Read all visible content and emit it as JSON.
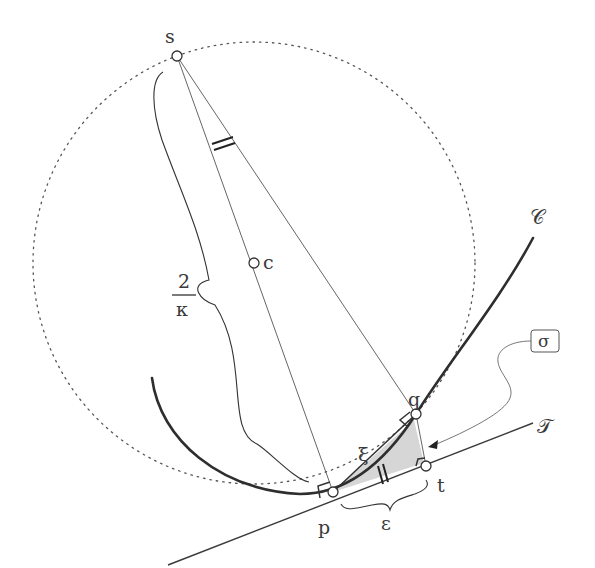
{
  "diagram": {
    "points": {
      "s": {
        "label": "s",
        "x": 177,
        "y": 56
      },
      "c": {
        "label": "c",
        "x": 254,
        "y": 263
      },
      "p": {
        "label": "p",
        "x": 333,
        "y": 492
      },
      "q": {
        "label": "q",
        "x": 416,
        "y": 414
      },
      "t": {
        "label": "t",
        "x": 426,
        "y": 466
      }
    },
    "labels": {
      "curve": "𝒞",
      "tangent": "𝒯",
      "sigma": "σ",
      "xi": "ξ",
      "epsilon": "ε",
      "diameter_numerator": "2",
      "diameter_denominator": "κ"
    },
    "circle": {
      "center": "c",
      "radius": 221,
      "style": "dotted"
    },
    "colors": {
      "stroke": "#3a3a3a",
      "thin": "#555555",
      "shade": "#d6d6d6",
      "background": "#ffffff"
    }
  }
}
